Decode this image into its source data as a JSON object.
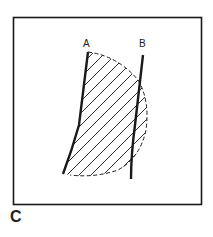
{
  "figure": {
    "panel_label": "C",
    "line_labels": {
      "a": "A",
      "b": "B"
    },
    "colors": {
      "stroke": "#1a1a1a",
      "background": "#ffffff"
    }
  }
}
